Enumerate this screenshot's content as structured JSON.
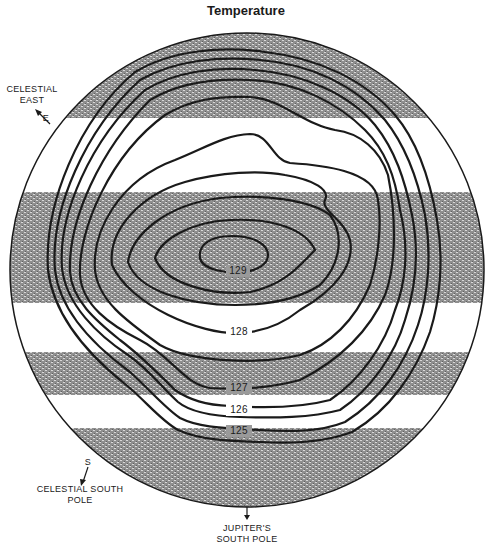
{
  "title": "Temperature",
  "labels": {
    "celestial_east": [
      "CELESTIAL",
      "EAST"
    ],
    "east_marker": "E",
    "south_marker": "S",
    "celestial_south_pole": [
      "CELESTIAL SOUTH",
      "POLE"
    ],
    "jupiter_south_pole": [
      "JUPITER'S",
      "SOUTH POLE"
    ]
  },
  "contours": [
    {
      "value": "129",
      "label": "129"
    },
    {
      "value": "128",
      "label": "128"
    },
    {
      "value": "127",
      "label": "127"
    },
    {
      "value": "126",
      "label": "126"
    },
    {
      "value": "125",
      "label": "125"
    }
  ],
  "colors": {
    "band": "#9a9a9a",
    "line": "#1a1a1a",
    "background": "#ffffff"
  }
}
